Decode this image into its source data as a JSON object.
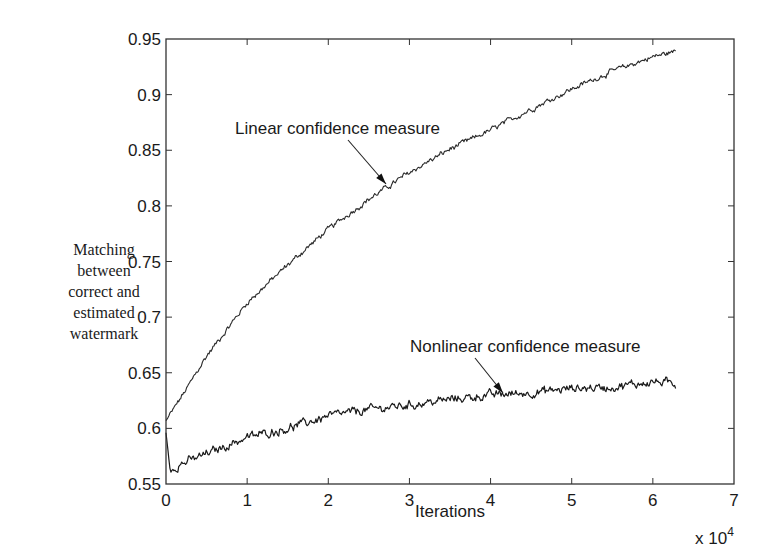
{
  "chart_data": {
    "type": "line",
    "title": "",
    "xlabel": "Iterations",
    "x_multiplier": "x 10",
    "x_multiplier_exponent": "4",
    "ylabel_lines": [
      "Matching",
      "between",
      "correct and",
      "estimated",
      "watermark"
    ],
    "xlim": [
      0,
      7
    ],
    "ylim": [
      0.55,
      0.95
    ],
    "x_ticks": [
      0,
      1,
      2,
      3,
      4,
      5,
      6,
      7
    ],
    "x_tick_labels": [
      "0",
      "1",
      "2",
      "3",
      "4",
      "5",
      "6",
      "7"
    ],
    "y_ticks": [
      0.55,
      0.6,
      0.65,
      0.7,
      0.75,
      0.8,
      0.85,
      0.9,
      0.95
    ],
    "y_tick_labels": [
      "0.55",
      "0.6",
      "0.65",
      "0.7",
      "0.75",
      "0.8",
      "0.85",
      "0.9",
      "0.95"
    ],
    "grid": false,
    "legend": "none (inline annotations with arrows)",
    "series": [
      {
        "name": "Linear confidence measure",
        "x": [
          0,
          0.25,
          0.5,
          1,
          1.5,
          2,
          2.5,
          3,
          3.5,
          4,
          4.5,
          5,
          5.5,
          6,
          6.28
        ],
        "values": [
          0.607,
          0.635,
          0.665,
          0.713,
          0.747,
          0.779,
          0.806,
          0.83,
          0.851,
          0.868,
          0.887,
          0.905,
          0.921,
          0.934,
          0.939
        ],
        "noise": 0.0025,
        "color": "#2a2a2a"
      },
      {
        "name": "Nonlinear confidence measure",
        "x": [
          0,
          0.05,
          0.15,
          0.5,
          1,
          1.5,
          2,
          2.5,
          3,
          3.5,
          4,
          4.5,
          5,
          5.5,
          6,
          6.28
        ],
        "values": [
          0.596,
          0.563,
          0.567,
          0.577,
          0.592,
          0.6,
          0.611,
          0.617,
          0.621,
          0.626,
          0.63,
          0.632,
          0.636,
          0.637,
          0.642,
          0.64
        ],
        "noise": 0.004,
        "color": "#1a1a1a"
      }
    ],
    "annotations": [
      {
        "text": "Linear confidence measure",
        "text_x": 235,
        "text_y": 134,
        "arrow_from": [
          348,
          140
        ],
        "arrow_to": [
          386,
          184
        ]
      },
      {
        "text": "Nonlinear confidence measure",
        "text_x": 410,
        "text_y": 352,
        "arrow_from": [
          475,
          358
        ],
        "arrow_to": [
          503,
          393
        ]
      }
    ]
  },
  "layout_px": {
    "plot_left": 166,
    "plot_right": 734,
    "plot_top": 39,
    "plot_bottom": 484
  }
}
